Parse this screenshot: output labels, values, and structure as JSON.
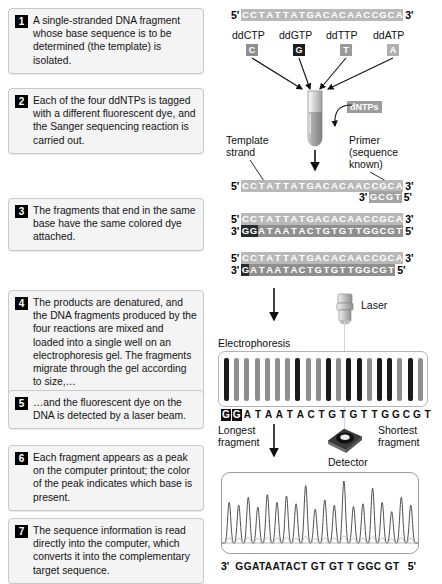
{
  "steps": [
    {
      "num": "1",
      "text": "A single-stranded DNA fragment whose base sequence is to be determined (the template) is isolated."
    },
    {
      "num": "2",
      "text": "Each of the four ddNTPs is tagged with a different fluorescent dye, and the Sanger sequencing reaction is carried out."
    },
    {
      "num": "3",
      "text": "The fragments that end in the same base have the same colored dye attached."
    },
    {
      "num": "4",
      "text": "The products are denatured, and the DNA fragments produced by the four reactions are mixed and loaded into a single well on an electrophoresis gel. The fragments migrate through the gel according to size,…"
    },
    {
      "num": "5",
      "text": "…and the fluorescent dye on the DNA is detected by a laser beam."
    },
    {
      "num": "6",
      "text": "Each fragment appears as a peak on the computer printout; the color of the peak indicates which base is present."
    },
    {
      "num": "7",
      "text": "The sequence information is read directly into the computer, which converts it into the complementary target sequence."
    }
  ],
  "ddntps": {
    "labels": [
      "ddCTP",
      "ddGTP",
      "ddTTP",
      "ddATP"
    ],
    "bases": [
      "C",
      "G",
      "T",
      "A"
    ],
    "colors": [
      "#8f8f8f",
      "#1c1c1c",
      "#9a9a9a",
      "#b0b0b0"
    ],
    "dntps_label": "dNTPs"
  },
  "annotations": {
    "template_strand": "Template\nstrand",
    "template_strand_l1": "Template",
    "template_strand_l2": "strand",
    "primer_l1": "Primer",
    "primer_l2": "(sequence",
    "primer_l3": "known)",
    "electrophoresis": "Electrophoresis",
    "laser": "Laser",
    "detector": "Detector",
    "longest_l1": "Longest",
    "longest_l2": "fragment",
    "shortest_l1": "Shortest",
    "shortest_l2": "fragment"
  },
  "sequences": {
    "five_prime": "5'",
    "three_prime": "3'",
    "template": "CCTATTATGACACAACCGCA",
    "primer_short": "GCGT",
    "product_full": "GGATAATACTGTGTTGGCGT",
    "product_a_terminal_count": 2,
    "product_b_terminal_count": 1,
    "readout": "GGATAATACTGTGTTGGCGT",
    "readout_boxed_count": 2,
    "final_sequence": "GGATAATACT GT GT T GGC GT"
  },
  "gel": {
    "band_count": 20,
    "band_shades": [
      "#1a1a1a",
      "#8e8e8e",
      "#8e8e8e",
      "#8e8e8e",
      "#8e8e8e",
      "#8e8e8e",
      "#8e8e8e",
      "#1a1a1a",
      "#8e8e8e",
      "#8e8e8e",
      "#1a1a1a",
      "#8e8e8e",
      "#1a1a1a",
      "#1a1a1a",
      "#8e8e8e",
      "#1a1a1a",
      "#1a1a1a",
      "#8e8e8e",
      "#1a1a1a",
      "#8e8e8e"
    ]
  },
  "chart_data": {
    "type": "line",
    "xlabel": "",
    "ylabel": "Fluorescence intensity",
    "categories": [
      "G",
      "G",
      "A",
      "T",
      "A",
      "A",
      "T",
      "A",
      "C",
      "T",
      "G",
      "T",
      "G",
      "T",
      "T",
      "G",
      "G",
      "C",
      "G",
      "T"
    ],
    "values": [
      62,
      58,
      70,
      55,
      74,
      62,
      72,
      60,
      88,
      52,
      66,
      58,
      95,
      56,
      60,
      84,
      62,
      48,
      70,
      58
    ],
    "grid": false,
    "legend": "none"
  }
}
